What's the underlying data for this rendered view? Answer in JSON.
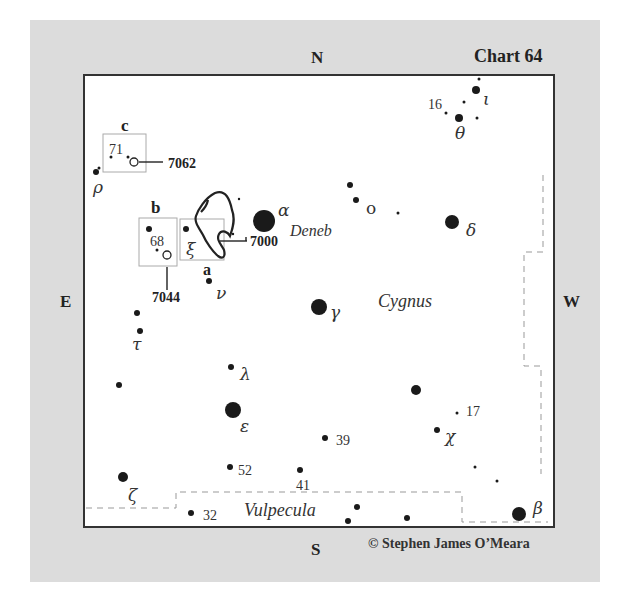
{
  "chart": {
    "title": "Chart 64",
    "credit": "© Stephen James O’Meara",
    "constellation": "Cygnus",
    "neighbor_constellation": "Vulpecula",
    "directions": {
      "north": "N",
      "south": "S",
      "east": "E",
      "west": "W"
    }
  },
  "stars": [
    {
      "id": "alpha",
      "label": "α",
      "name": "Deneb",
      "x": 264,
      "y": 221,
      "r": 11
    },
    {
      "id": "gamma",
      "label": "γ",
      "x": 319,
      "y": 307,
      "r": 8
    },
    {
      "id": "delta",
      "label": "δ",
      "x": 452,
      "y": 222,
      "r": 7
    },
    {
      "id": "epsilon",
      "label": "ε",
      "x": 233,
      "y": 410,
      "r": 8
    },
    {
      "id": "beta",
      "label": "β",
      "x": 519,
      "y": 514,
      "r": 7
    },
    {
      "id": "zeta",
      "label": "ζ",
      "x": 123,
      "y": 477,
      "r": 5
    },
    {
      "id": "lambda",
      "label": "λ",
      "x": 231,
      "y": 367,
      "r": 3
    },
    {
      "id": "nu",
      "label": "ν",
      "x": 209,
      "y": 281,
      "r": 3
    },
    {
      "id": "xi",
      "label": "ξ",
      "x": 186,
      "y": 229,
      "r": 3
    },
    {
      "id": "tau",
      "label": "τ",
      "x": 140,
      "y": 331,
      "r": 3
    },
    {
      "id": "rho",
      "label": "ρ",
      "x": 96,
      "y": 172,
      "r": 3
    },
    {
      "id": "omicron",
      "label": "o",
      "x": 356,
      "y": 200,
      "r": 3
    },
    {
      "id": "theta",
      "label": "θ",
      "x": 459,
      "y": 118,
      "r": 4
    },
    {
      "id": "iota",
      "label": "ι",
      "x": 476,
      "y": 90,
      "r": 4
    },
    {
      "id": "chi",
      "label": "χ",
      "x": 437,
      "y": 430,
      "r": 3
    },
    {
      "id": "s16",
      "label": "16",
      "x": 446,
      "y": 113,
      "r": 2
    },
    {
      "id": "s17",
      "label": "17",
      "x": 457,
      "y": 413,
      "r": 2
    },
    {
      "id": "s39",
      "label": "39",
      "x": 325,
      "y": 438,
      "r": 3
    },
    {
      "id": "s41",
      "label": "41",
      "x": 300,
      "y": 470,
      "r": 3
    },
    {
      "id": "s52",
      "label": "52",
      "x": 230,
      "y": 467,
      "r": 3
    },
    {
      "id": "s32",
      "label": "32",
      "x": 191,
      "y": 513,
      "r": 3
    },
    {
      "id": "s68",
      "label": "68",
      "x": 157,
      "y": 250,
      "r": 2
    },
    {
      "id": "s71",
      "label": "71",
      "x": 111,
      "y": 157,
      "r": 2
    }
  ],
  "objects": [
    {
      "id": "ngc7000",
      "label": "7000",
      "marker": "a"
    },
    {
      "id": "ngc7044",
      "label": "7044",
      "marker": "b"
    },
    {
      "id": "ngc7062",
      "label": "7062",
      "marker": "c"
    }
  ]
}
